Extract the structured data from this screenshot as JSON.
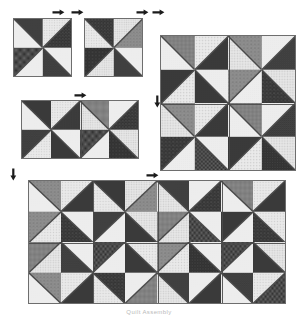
{
  "figure": {
    "kind": "quilt-assembly-diagram",
    "caption": "Quilt Assembly",
    "background_color": "#ffffff",
    "outline_color": "#6e6e6e",
    "seam_color": "#4a4a4a",
    "top_margin_artifact_left": "",
    "top_margin_artifact_right": ""
  },
  "palette": {
    "light": "#e9e9e9",
    "light_alt": "#dedede",
    "mid": "#9a9a9a",
    "mid_dark": "#6a6a6a",
    "dark": "#3c3c3c",
    "very_dark": "#232323"
  },
  "fabric_legend": [
    {
      "id": "lt-dot",
      "name": "light dotted print",
      "base": "#e9e9e9",
      "ink": "#9b9b9b",
      "motif": "dots"
    },
    {
      "id": "lt-star",
      "name": "light star print",
      "base": "#ebebeb",
      "ink": "#a8a8a8",
      "motif": "stars"
    },
    {
      "id": "lt-plain",
      "name": "light tone-on-tone",
      "base": "#ededed",
      "ink": "#c9c9c9",
      "motif": "speck"
    },
    {
      "id": "lt-cross",
      "name": "light cross print",
      "base": "#e6e6e6",
      "ink": "#9e9e9e",
      "motif": "crosses"
    },
    {
      "id": "md-floral",
      "name": "medium floral print",
      "base": "#8f8f8f",
      "ink": "#5e5e5e",
      "motif": "blooms"
    },
    {
      "id": "md-grid",
      "name": "medium grid print",
      "base": "#8a8a8a",
      "ink": "#4f4f4f",
      "motif": "grid"
    },
    {
      "id": "dk-solid",
      "name": "dark solid",
      "base": "#3a3a3a",
      "ink": "#2a2a2a",
      "motif": "speck"
    },
    {
      "id": "dk-speck",
      "name": "dark speckled print",
      "base": "#3f3f3f",
      "ink": "#6b6b6b",
      "motif": "speck"
    },
    {
      "id": "dk-check",
      "name": "dark checkerboard print",
      "base": "#2c2c2c",
      "ink": "#6e6e6e",
      "motif": "check"
    },
    {
      "id": "dk-bloom",
      "name": "dark bloom print",
      "base": "#343434",
      "ink": "#707070",
      "motif": "blooms"
    },
    {
      "id": "dk-dot",
      "name": "dark dot print",
      "base": "#303030",
      "ink": "#787878",
      "motif": "dots"
    },
    {
      "id": "dk-dash",
      "name": "dark dash print",
      "base": "#383838",
      "ink": "#7a7a7a",
      "motif": "dash"
    }
  ],
  "diagrams": [
    {
      "id": "unit-block-a",
      "label": "Block A",
      "x": 13,
      "y": 18,
      "w": 59,
      "h": 59,
      "cols": 2,
      "rows": 2,
      "block_cols": 1,
      "block_rows": 1,
      "units": [
        {
          "diag": "tl-br",
          "a": "lt-plain",
          "b": "dk-speck"
        },
        {
          "diag": "tr-bl",
          "a": "dk-bloom",
          "b": "lt-star"
        },
        {
          "diag": "tr-bl",
          "a": "lt-plain",
          "b": "dk-check"
        },
        {
          "diag": "tl-br",
          "a": "dk-dash",
          "b": "lt-plain"
        }
      ]
    },
    {
      "id": "unit-block-b",
      "label": "Block B",
      "x": 84,
      "y": 18,
      "w": 59,
      "h": 59,
      "cols": 2,
      "rows": 2,
      "block_cols": 1,
      "block_rows": 1,
      "units": [
        {
          "diag": "tl-br",
          "a": "lt-star",
          "b": "dk-bloom"
        },
        {
          "diag": "tr-bl",
          "a": "md-floral",
          "b": "lt-cross"
        },
        {
          "diag": "tr-bl",
          "a": "lt-cross",
          "b": "dk-dot"
        },
        {
          "diag": "tl-br",
          "a": "dk-speck",
          "b": "lt-plain"
        }
      ]
    },
    {
      "id": "row-pair",
      "label": "Two blocks joined",
      "x": 21,
      "y": 100,
      "w": 118,
      "h": 59,
      "cols": 4,
      "rows": 2,
      "block_cols": 2,
      "block_rows": 1,
      "units": [
        {
          "diag": "tl-br",
          "a": "lt-plain",
          "b": "dk-solid"
        },
        {
          "diag": "tr-bl",
          "a": "dk-grid",
          "b": "lt-star"
        },
        {
          "diag": "tl-br",
          "a": "lt-cross",
          "b": "md-grid"
        },
        {
          "diag": "tr-bl",
          "a": "dk-bloom",
          "b": "lt-plain"
        },
        {
          "diag": "tr-bl",
          "a": "lt-star",
          "b": "dk-dash"
        },
        {
          "diag": "tl-br",
          "a": "dk-solid",
          "b": "lt-plain"
        },
        {
          "diag": "tr-bl",
          "a": "lt-plain",
          "b": "dk-check"
        },
        {
          "diag": "tl-br",
          "a": "dk-dot",
          "b": "lt-cross"
        }
      ]
    },
    {
      "id": "four-block",
      "label": "Four blocks joined",
      "x": 160,
      "y": 35,
      "w": 136,
      "h": 136,
      "cols": 4,
      "rows": 4,
      "block_cols": 2,
      "block_rows": 2,
      "units": [
        {
          "diag": "tl-br",
          "a": "lt-plain",
          "b": "md-grid"
        },
        {
          "diag": "tr-bl",
          "a": "dk-solid",
          "b": "lt-star"
        },
        {
          "diag": "tl-br",
          "a": "lt-cross",
          "b": "md-floral"
        },
        {
          "diag": "tr-bl",
          "a": "dk-speck",
          "b": "lt-plain"
        },
        {
          "diag": "tr-bl",
          "a": "lt-star",
          "b": "dk-solid"
        },
        {
          "diag": "tl-br",
          "a": "dk-solid",
          "b": "lt-plain"
        },
        {
          "diag": "tr-bl",
          "a": "lt-plain",
          "b": "md-floral"
        },
        {
          "diag": "tl-br",
          "a": "dk-bloom",
          "b": "lt-cross"
        },
        {
          "diag": "tl-br",
          "a": "lt-cross",
          "b": "md-floral"
        },
        {
          "diag": "tr-bl",
          "a": "dk-solid",
          "b": "lt-star"
        },
        {
          "diag": "tl-br",
          "a": "lt-plain",
          "b": "md-grid"
        },
        {
          "diag": "tr-bl",
          "a": "dk-dash",
          "b": "lt-plain"
        },
        {
          "diag": "tr-bl",
          "a": "lt-plain",
          "b": "dk-bloom"
        },
        {
          "diag": "tl-br",
          "a": "dk-check",
          "b": "lt-plain"
        },
        {
          "diag": "tr-bl",
          "a": "lt-star",
          "b": "dk-solid"
        },
        {
          "diag": "tl-br",
          "a": "dk-dot",
          "b": "lt-cross"
        }
      ]
    },
    {
      "id": "full-quilt-top",
      "label": "Assembled quilt top",
      "x": 28,
      "y": 180,
      "w": 258,
      "h": 124,
      "cols": 8,
      "rows": 4,
      "block_cols": 4,
      "block_rows": 2,
      "units": [
        {
          "diag": "tl-br",
          "a": "lt-plain",
          "b": "md-floral"
        },
        {
          "diag": "tr-bl",
          "a": "dk-solid",
          "b": "lt-star"
        },
        {
          "diag": "tl-br",
          "a": "lt-star",
          "b": "dk-solid"
        },
        {
          "diag": "tr-bl",
          "a": "md-floral",
          "b": "lt-cross"
        },
        {
          "diag": "tl-br",
          "a": "lt-cross",
          "b": "dk-speck"
        },
        {
          "diag": "tr-bl",
          "a": "dk-bloom",
          "b": "lt-plain"
        },
        {
          "diag": "tl-br",
          "a": "lt-plain",
          "b": "md-grid"
        },
        {
          "diag": "tr-bl",
          "a": "dk-solid",
          "b": "lt-star"
        },
        {
          "diag": "tr-bl",
          "a": "lt-star",
          "b": "md-floral"
        },
        {
          "diag": "tl-br",
          "a": "dk-bloom",
          "b": "lt-plain"
        },
        {
          "diag": "tr-bl",
          "a": "lt-plain",
          "b": "dk-speck"
        },
        {
          "diag": "tl-br",
          "a": "dk-solid",
          "b": "lt-cross"
        },
        {
          "diag": "tr-bl",
          "a": "lt-cross",
          "b": "md-grid"
        },
        {
          "diag": "tl-br",
          "a": "dk-check",
          "b": "lt-plain"
        },
        {
          "diag": "tr-bl",
          "a": "lt-plain",
          "b": "dk-solid"
        },
        {
          "diag": "tl-br",
          "a": "dk-bloom",
          "b": "lt-star"
        },
        {
          "diag": "tr-bl",
          "a": "lt-cross",
          "b": "md-grid"
        },
        {
          "diag": "tl-br",
          "a": "dk-dash",
          "b": "lt-plain"
        },
        {
          "diag": "tr-bl",
          "a": "lt-plain",
          "b": "dk-check"
        },
        {
          "diag": "tl-br",
          "a": "dk-solid",
          "b": "lt-star"
        },
        {
          "diag": "tr-bl",
          "a": "lt-star",
          "b": "md-floral"
        },
        {
          "diag": "tl-br",
          "a": "dk-dot",
          "b": "lt-plain"
        },
        {
          "diag": "tr-bl",
          "a": "lt-plain",
          "b": "dk-check"
        },
        {
          "diag": "tl-br",
          "a": "dk-solid",
          "b": "lt-cross"
        },
        {
          "diag": "tl-br",
          "a": "lt-plain",
          "b": "md-floral"
        },
        {
          "diag": "tr-bl",
          "a": "dk-solid",
          "b": "lt-star"
        },
        {
          "diag": "tl-br",
          "a": "lt-star",
          "b": "dk-bloom"
        },
        {
          "diag": "tr-bl",
          "a": "md-grid",
          "b": "lt-plain"
        },
        {
          "diag": "tl-br",
          "a": "lt-cross",
          "b": "dk-speck"
        },
        {
          "diag": "tr-bl",
          "a": "dk-solid",
          "b": "lt-plain"
        },
        {
          "diag": "tl-br",
          "a": "lt-plain",
          "b": "dk-dash"
        },
        {
          "diag": "tr-bl",
          "a": "dk-check",
          "b": "lt-star"
        }
      ]
    }
  ],
  "markers": [
    {
      "id": "m1",
      "dir": "horizontal",
      "x": 52,
      "y": 9,
      "note": "pressing direction, block A top"
    },
    {
      "id": "m2",
      "dir": "horizontal",
      "x": 71,
      "y": 9,
      "note": "pressing direction, block A/B seam"
    },
    {
      "id": "m3",
      "dir": "horizontal",
      "x": 136,
      "y": 9,
      "note": "pressing direction, block B top"
    },
    {
      "id": "m4",
      "dir": "horizontal",
      "x": 152,
      "y": 9,
      "note": "pressing direction, block B right"
    },
    {
      "id": "m5",
      "dir": "horizontal",
      "x": 74,
      "y": 92,
      "note": "pressing direction, row pair"
    },
    {
      "id": "m6",
      "dir": "vertical",
      "x": 154,
      "y": 95,
      "note": "pressing direction, four-block left"
    },
    {
      "id": "m7",
      "dir": "vertical",
      "x": 10,
      "y": 168,
      "note": "pressing direction, quilt top left"
    },
    {
      "id": "m8",
      "dir": "horizontal",
      "x": 146,
      "y": 172,
      "note": "pressing direction, quilt top"
    }
  ],
  "caption_position": {
    "x": 0,
    "y": 309
  }
}
